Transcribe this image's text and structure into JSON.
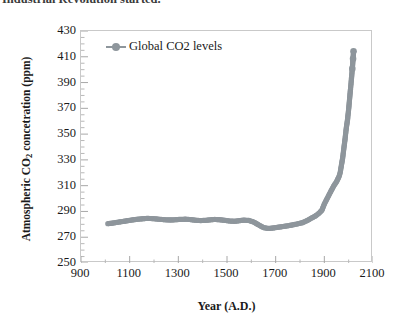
{
  "caption": {
    "text": "Industrial Revolution started."
  },
  "chart_data": {
    "type": "scatter",
    "title": "",
    "xlabel": "Year (A.D.)",
    "ylabel_prefix": "Atmospheric CO",
    "ylabel_sub": "2",
    "ylabel_suffix": " concetration (ppm)",
    "legend": [
      {
        "name": "Global CO2 levels",
        "color": "#8e969c",
        "marker": "circle"
      }
    ],
    "legend_position": "top-left-inside",
    "grid": false,
    "xlim": [
      900,
      2100
    ],
    "ylim": [
      250,
      430
    ],
    "xticks": [
      900,
      1100,
      1300,
      1500,
      1700,
      1900,
      2100
    ],
    "yticks": [
      250,
      270,
      290,
      310,
      330,
      350,
      370,
      390,
      410,
      430
    ],
    "x_minor_tick_interval": 100,
    "y_minor_tick_interval": 5,
    "series": [
      {
        "name": "Global CO2 levels",
        "x": [
          1010,
          1030,
          1050,
          1070,
          1090,
          1110,
          1130,
          1150,
          1170,
          1190,
          1210,
          1230,
          1250,
          1270,
          1290,
          1310,
          1330,
          1350,
          1370,
          1390,
          1410,
          1430,
          1450,
          1470,
          1490,
          1510,
          1530,
          1550,
          1570,
          1590,
          1610,
          1630,
          1650,
          1670,
          1690,
          1710,
          1730,
          1750,
          1770,
          1790,
          1810,
          1830,
          1850,
          1860,
          1870,
          1880,
          1890,
          1900,
          1910,
          1920,
          1930,
          1940,
          1950,
          1955,
          1960,
          1965,
          1970,
          1975,
          1980,
          1985,
          1990,
          1995,
          2000,
          2005,
          2010,
          2015,
          2018,
          2020
        ],
        "y": [
          280.5,
          281.0,
          281.6,
          282.2,
          282.8,
          283.4,
          283.9,
          284.3,
          284.6,
          284.5,
          284.2,
          283.8,
          283.5,
          283.4,
          283.6,
          283.9,
          284.0,
          283.7,
          283.2,
          282.9,
          283.1,
          283.5,
          283.8,
          283.6,
          283.1,
          282.6,
          282.4,
          282.8,
          283.3,
          283.0,
          281.8,
          279.6,
          277.5,
          276.8,
          277.2,
          277.8,
          278.3,
          278.9,
          279.6,
          280.4,
          281.3,
          283.0,
          285.2,
          286.1,
          287.4,
          289.0,
          291.0,
          295.8,
          299.5,
          303.2,
          306.8,
          310.3,
          313.0,
          315.0,
          316.9,
          320.0,
          325.7,
          331.1,
          338.7,
          346.0,
          354.4,
          360.8,
          369.5,
          379.8,
          389.9,
          400.8,
          408.5,
          414.2
        ]
      }
    ],
    "annotations": []
  }
}
